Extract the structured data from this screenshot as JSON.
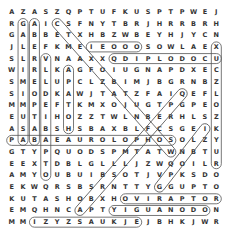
{
  "puzzle": {
    "type": "word-search",
    "rows": 19,
    "cols": 19,
    "grid": [
      "AZASZQPTUFKUSPTPWEJK",
      "RGAICSFNYTBRJHRRBRH",
      "GABBETXHBZWBEYHJYCNE",
      "JLEFKMEIEOOOSOWLAEXA",
      "SLRVNAAXXQDIPLODOCUSR",
      "WIRLKAGFOIUGNAPDXECK",
      "SMELUPCLZBIMJBGRNBZY",
      "SIODKAWJTATZFAIQEFL",
      "MMPEFTKMXOJUGTPGPEO",
      "EUTIHOZZTWLNBERHLSZS",
      "ASABSHSBAXBLFCSGEIKA",
      "PABAEAUROLOPHOSOLZYU",
      "GTYPQUODSPMTATWNBTUR",
      "EEXTDBLGLLLJZWQOILRGU",
      "AMYOUBUIBSOTJVPKSDOS",
      "EKWQRSBSRNTTYGGUPTOF",
      "KUTASHOBXHOVIRAPTOR",
      "EMQHNCAPTYIGUANODONF",
      "MMIZYZSAUKJEJBHKJWRY",
      "JETRICERATOPSRUALKUU"
    ],
    "found_words": [
      "STEGOSAURUS",
      "DIPLODOCUS",
      "PARASAUROLOPHUS",
      "VELOCIRAPTOR",
      "OVIRAPTOR",
      "IGUANODON",
      "TRICERATOPS",
      "ALLOSAURUS"
    ]
  }
}
